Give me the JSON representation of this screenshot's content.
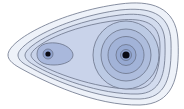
{
  "diagram": {
    "type": "contour-plot",
    "colors": {
      "background": "#ffffff",
      "stroke": "#6b7389",
      "levels": [
        "#eef2f9",
        "#dfe6f3",
        "#d2dbee",
        "#c5d0e8",
        "#b8c5e2",
        "#aab9dc",
        "#9cadd5",
        "#8fa2cf"
      ],
      "point": "#0a0a14"
    },
    "points": [
      {
        "label": "left-minimum",
        "x": 48,
        "y": 54
      },
      {
        "label": "right-minimum",
        "x": 126,
        "y": 55
      }
    ]
  }
}
